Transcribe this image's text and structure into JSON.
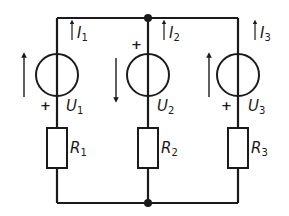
{
  "diagram": {
    "type": "electrical-circuit",
    "colors": {
      "ink": "#1a1a1a",
      "background": "#ffffff"
    },
    "branches": [
      {
        "id": 1,
        "current": {
          "symbol": "I",
          "sub": "1",
          "direction": "up"
        },
        "source": {
          "symbol": "U",
          "sub": "1",
          "plus_position": "bottom",
          "arrow_direction": "up"
        },
        "resistor": {
          "symbol": "R",
          "sub": "1"
        }
      },
      {
        "id": 2,
        "current": {
          "symbol": "I",
          "sub": "2",
          "direction": "up"
        },
        "source": {
          "symbol": "U",
          "sub": "2",
          "plus_position": "top",
          "arrow_direction": "down"
        },
        "resistor": {
          "symbol": "R",
          "sub": "2"
        }
      },
      {
        "id": 3,
        "current": {
          "symbol": "I",
          "sub": "3",
          "direction": "up"
        },
        "source": {
          "symbol": "U",
          "sub": "3",
          "plus_position": "bottom",
          "arrow_direction": "up"
        },
        "resistor": {
          "symbol": "R",
          "sub": "3"
        }
      }
    ],
    "nodes": [
      "top-node",
      "bottom-node"
    ],
    "plus_sign": "+"
  }
}
